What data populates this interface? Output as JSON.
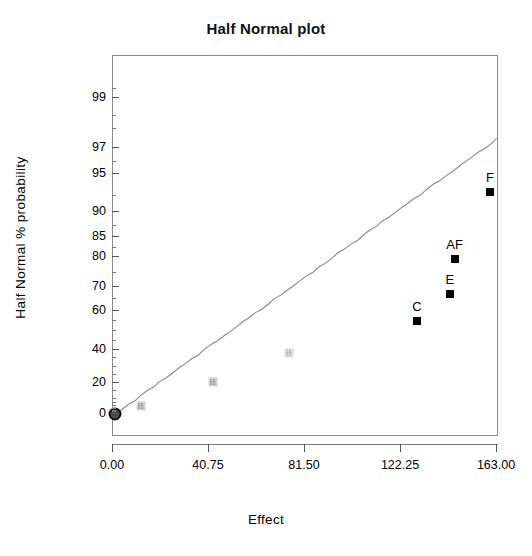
{
  "chart_data": {
    "type": "scatter",
    "title": "Half Normal plot",
    "xlabel": "Effect",
    "ylabel": "Half Normal % probability",
    "xlim": [
      0.0,
      163.0
    ],
    "ylim": [
      0,
      99
    ],
    "grid": false,
    "legend": null,
    "xticks": [
      {
        "value": 0.0,
        "label": "0.00"
      },
      {
        "value": 40.75,
        "label": "40.75"
      },
      {
        "value": 81.5,
        "label": "81.50"
      },
      {
        "value": 122.25,
        "label": "122.25"
      },
      {
        "value": 163.0,
        "label": "163.00"
      }
    ],
    "yticks": [
      {
        "value": 0,
        "label": "0"
      },
      {
        "value": 20,
        "label": "20"
      },
      {
        "value": 40,
        "label": "40"
      },
      {
        "value": 60,
        "label": "60"
      },
      {
        "value": 70,
        "label": "70"
      },
      {
        "value": 80,
        "label": "80"
      },
      {
        "value": 85,
        "label": "85"
      },
      {
        "value": 90,
        "label": "90"
      },
      {
        "value": 95,
        "label": "95"
      },
      {
        "value": 97,
        "label": "97"
      },
      {
        "value": 99,
        "label": "99"
      }
    ],
    "points": [
      {
        "label": "",
        "x": 1.0,
        "y": 0.0,
        "style": "circle"
      },
      {
        "label": "",
        "x": 12.0,
        "y": 5.5,
        "style": "gray-square"
      },
      {
        "label": "",
        "x": 42.5,
        "y": 20.5,
        "style": "gray-square"
      },
      {
        "label": "",
        "x": 74.5,
        "y": 38.0,
        "style": "gray-square-faint"
      },
      {
        "label": "C",
        "x": 129.0,
        "y": 55.0,
        "style": "black-square"
      },
      {
        "label": "E",
        "x": 143.0,
        "y": 67.0,
        "style": "black-square"
      },
      {
        "label": "AF",
        "x": 145.0,
        "y": 79.5,
        "style": "black-square"
      },
      {
        "label": "F",
        "x": 160.0,
        "y": 93.0,
        "style": "black-square"
      }
    ],
    "reference_line": {
      "description": "half-normal reference line through origin",
      "x_start": 1.0,
      "y_start": 0.0,
      "x_end": 163.0,
      "y_end": 97.5
    },
    "colors": {
      "marker_significant": "#000000",
      "marker_nonsignificant": "#8a8a8a",
      "origin_marker": "#4a4a4a",
      "line": "#888888",
      "frame": "#8b8b8b",
      "background": "#ffffff"
    }
  }
}
